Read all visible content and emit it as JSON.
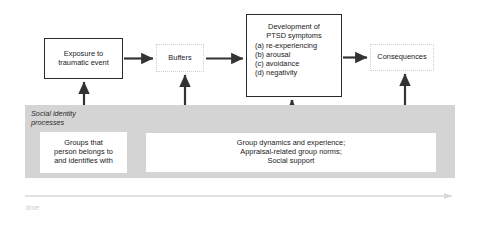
{
  "diagram": {
    "colors": {
      "band_gray": "#d4d4d4",
      "box_border": "#2b2b2b",
      "faint_border": "#cfcfcf",
      "arrow": "#333333",
      "time_arrow": "#d8d8d8",
      "text": "#1a1a1a"
    },
    "nodes": {
      "exposure": {
        "name": "Exposure to traumatic event",
        "line1": "Exposure to",
        "line2": "traumatic event",
        "border": "solid"
      },
      "buffers": {
        "name": "Buffers",
        "line1": "Buffers",
        "border": "faint-dotted"
      },
      "ptsd": {
        "name": "Development of PTSD symptoms",
        "head1": "Development of",
        "head2": "PTSD symptoms",
        "items": [
          "(a) re-experiencing",
          "(b) arousal",
          "(c) avoidance",
          "(d) negativity"
        ],
        "border": "solid"
      },
      "consequences": {
        "name": "Consequences",
        "line1": "Consequences",
        "border": "faint-dotted"
      },
      "groups": {
        "name": "Groups that person belongs to and identifies with",
        "line1": "Groups that",
        "line2": "person belongs to",
        "line3": "and identifies with",
        "border": "none"
      },
      "group_dynamics": {
        "name": "Group dynamics and experience; Appraisal-related group norms; Social support",
        "line1": "Group dynamics and experience;",
        "line2": "Appraisal-related group norms;",
        "line3": "Social support",
        "border": "none"
      }
    },
    "band": {
      "label_line1": "Social identity",
      "label_line2": "processes"
    },
    "time_axis": {
      "label": "time"
    },
    "flow_arrows": [
      {
        "from": "exposure",
        "to": "buffers",
        "direction": "right"
      },
      {
        "from": "buffers",
        "to": "ptsd",
        "direction": "right"
      },
      {
        "from": "ptsd",
        "to": "consequences",
        "direction": "right"
      },
      {
        "from": "groups",
        "to": "exposure",
        "direction": "up"
      },
      {
        "from": "group_dynamics",
        "to": "buffers",
        "direction": "up"
      },
      {
        "from": "group_dynamics",
        "to": "ptsd",
        "direction": "up"
      },
      {
        "from": "group_dynamics",
        "to": "consequences",
        "direction": "up"
      }
    ]
  }
}
